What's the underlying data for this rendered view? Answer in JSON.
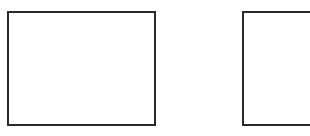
{
  "boxes": [
    {
      "id": "box1",
      "border_color": "#2a2a2a",
      "fill": "#ffffff"
    },
    {
      "id": "box2",
      "border_color": "#2a2a2a",
      "fill": "#ffffff"
    }
  ]
}
